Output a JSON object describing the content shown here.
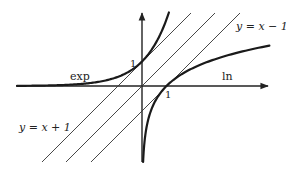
{
  "figure": {
    "colors": {
      "curve": "#1a1a1a",
      "line": "#333333",
      "axis": "#222222",
      "background": "#ffffff"
    },
    "origin_px": [
      142,
      86
    ],
    "unit_px": 24.5,
    "x_range": [
      -5.1,
      5.2
    ],
    "y_range": [
      -3.1,
      3.0
    ]
  },
  "labels": {
    "exp": "exp",
    "ln": "ln",
    "line_plus": "y = x + 1",
    "line_minus": "y = x − 1",
    "tick_y_one": "1",
    "tick_x_one": "1"
  },
  "curves": [
    {
      "name": "exp",
      "formula": "y = e^x",
      "passes_through": [
        0,
        1
      ]
    },
    {
      "name": "ln",
      "formula": "y = ln x",
      "passes_through": [
        1,
        0
      ]
    }
  ],
  "lines": [
    {
      "name": "y = x + 1",
      "slope": 1,
      "intercept": 1
    },
    {
      "name": "y = x",
      "slope": 1,
      "intercept": 0
    },
    {
      "name": "y = x - 1",
      "slope": 1,
      "intercept": -1
    }
  ]
}
